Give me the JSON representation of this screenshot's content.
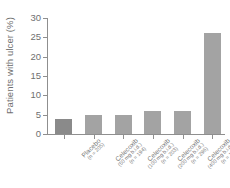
{
  "chart_data": {
    "type": "bar",
    "title": "",
    "subtitle": "",
    "xlabel": "",
    "ylabel": "Patients with ulcer (%)",
    "ylim": [
      0,
      30
    ],
    "yticks": [
      0,
      5,
      10,
      15,
      20,
      25,
      30
    ],
    "grid": false,
    "legend": null,
    "categories": [
      "Placebo",
      "Celecoxib",
      "Celecoxib",
      "Celecoxib",
      "Celecoxib",
      "Naproxen"
    ],
    "values": [
      4,
      5,
      5,
      6,
      6,
      26
    ],
    "bars": [
      {
        "name": "Placebo",
        "dose": "",
        "n_text": "(n = 205)",
        "value": 4,
        "color": "#8a8a8a"
      },
      {
        "name": "Celecoxib",
        "dose": "(50 mg b.i.d.)",
        "n_text": "(n = 194)",
        "value": 5,
        "color": "#a3a3a3"
      },
      {
        "name": "Celecoxib",
        "dose": "(100 mg b.i.d.)",
        "n_text": "(n = 203)",
        "value": 5,
        "color": "#a3a3a3"
      },
      {
        "name": "Celecoxib",
        "dose": "(200 mg b.i.d.)",
        "n_text": "(n = 296)",
        "value": 6,
        "color": "#a3a3a3"
      },
      {
        "name": "Celecoxib",
        "dose": "(400 mg b.i.d.)",
        "n_text": "(n = 198)",
        "value": 6,
        "color": "#a3a3a3"
      },
      {
        "name": "Naproxen",
        "dose": "(500 mg b.i.d.)",
        "n_text": "(n = 208)",
        "value": 26,
        "color": "#a3a3a3"
      }
    ],
    "colors": {
      "bar_highlight": "#8a8a8a",
      "bar_default": "#a3a3a3",
      "axis": "#8f8f8f",
      "text": "#6f6f6f",
      "background": "#ffffff"
    }
  }
}
